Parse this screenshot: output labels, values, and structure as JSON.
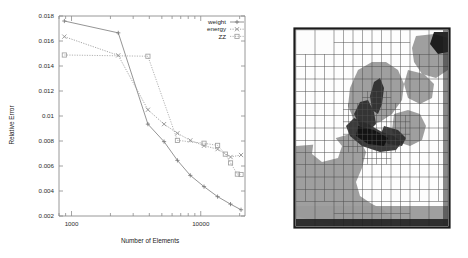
{
  "figure": {
    "left_panel_name": "convergence-plot",
    "right_panel_name": "adaptive-mesh-image"
  },
  "chart_data": {
    "type": "line",
    "title": "",
    "xlabel": "Number of Elements",
    "ylabel": "Relative Error",
    "xscale": "log",
    "yscale": "linear",
    "xlim": [
      800,
      22000
    ],
    "ylim": [
      0.002,
      0.018
    ],
    "xticks": [
      1000,
      10000
    ],
    "xtick_labels": [
      "1000",
      "10000"
    ],
    "yticks": [
      0.002,
      0.004,
      0.006,
      0.008,
      0.01,
      0.012,
      0.014,
      0.016,
      0.018
    ],
    "ytick_labels": [
      "0.002",
      "0.004",
      "0.006",
      "0.008",
      "0.01",
      "0.012",
      "0.014",
      "0.016",
      "0.018"
    ],
    "grid": false,
    "legend_position": "top-right",
    "series": [
      {
        "name": "weight",
        "color": "#7a7a7a",
        "marker": "plus",
        "dash": "solid",
        "x": [
          880,
          2300,
          3900,
          5200,
          6600,
          8300,
          10600,
          13500,
          17000,
          20500
        ],
        "y": [
          0.0176,
          0.01665,
          0.00935,
          0.00795,
          0.00645,
          0.00525,
          0.00435,
          0.00355,
          0.00295,
          0.0025
        ]
      },
      {
        "name": "energy",
        "color": "#8f8f8f",
        "marker": "cross",
        "dash": "dotted",
        "x": [
          880,
          2300,
          3900,
          5200,
          6600,
          8300,
          10600,
          13500,
          17000,
          20500
        ],
        "y": [
          0.01635,
          0.01485,
          0.0105,
          0.00935,
          0.00862,
          0.00805,
          0.00762,
          0.00735,
          0.00672,
          0.00688
        ]
      },
      {
        "name": "ZZ",
        "color": "#a0a0a0",
        "marker": "square",
        "dash": "dotted",
        "x": [
          880,
          3900,
          6600,
          10600,
          13500,
          15500,
          17000,
          19200,
          20500
        ],
        "y": [
          0.01488,
          0.01478,
          0.00805,
          0.00782,
          0.00765,
          0.00695,
          0.00625,
          0.00535,
          0.00532
        ]
      }
    ],
    "legend_entries": [
      {
        "label": "weight",
        "color": "#7a7a7a",
        "marker": "plus",
        "dash": "solid"
      },
      {
        "label": "energy",
        "color": "#8f8f8f",
        "marker": "cross",
        "dash": "dotted"
      },
      {
        "label": "ZZ",
        "color": "#a0a0a0",
        "marker": "square",
        "dash": "dotted"
      }
    ]
  },
  "mesh_image": {
    "caption": "",
    "description": "adaptive refined quadtree mesh over a grayscale field",
    "background_color": "#ffffff",
    "grid_line_color": "#505050",
    "border_color": "#1a1a1a",
    "region_colors": {
      "light": "#fdfdfd",
      "mid": "#9a9a9a",
      "dark": "#2a2a2a",
      "very_dark": "#101010"
    }
  }
}
